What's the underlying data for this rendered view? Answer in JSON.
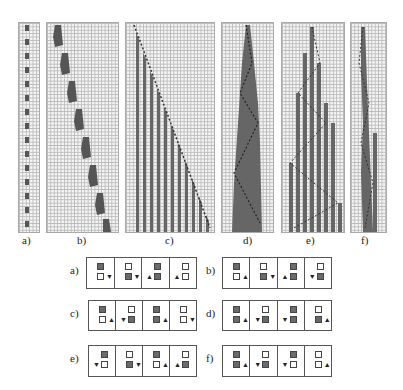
{
  "figure": {
    "top_panels": [
      {
        "label": "a)",
        "pattern": "narrow oscillating head column"
      },
      {
        "label": "b)",
        "pattern": "staircase glider moving right"
      },
      {
        "label": "c)",
        "pattern": "diagonal head leaving vertical stripes"
      },
      {
        "label": "d)",
        "pattern": "expanding filled triangle with zigzag head"
      },
      {
        "label": "e)",
        "pattern": "expanding striped triangle"
      },
      {
        "label": "f)",
        "pattern": "irregular narrow growth"
      }
    ],
    "rule_tables": [
      {
        "label": "a)",
        "cells": [
          {
            "top": "dark",
            "bottom": "light",
            "arrow": "down",
            "side": "right"
          },
          {
            "top": "light",
            "bottom": "dark",
            "arrow": "down",
            "side": "right"
          },
          {
            "top": "dark",
            "bottom": "dark",
            "arrow": "up",
            "side": "left"
          },
          {
            "top": "light",
            "bottom": "light",
            "arrow": "up",
            "side": "left"
          }
        ]
      },
      {
        "label": "b)",
        "cells": [
          {
            "top": "dark",
            "bottom": "light",
            "arrow": "up",
            "side": "right"
          },
          {
            "top": "light",
            "bottom": "dark",
            "arrow": "down",
            "side": "right"
          },
          {
            "top": "dark",
            "bottom": "dark",
            "arrow": "up",
            "side": "left"
          },
          {
            "top": "light",
            "bottom": "dark",
            "arrow": "down",
            "side": "left"
          }
        ]
      },
      {
        "label": "c)",
        "cells": [
          {
            "top": "dark",
            "bottom": "light",
            "arrow": "up",
            "side": "right"
          },
          {
            "top": "light",
            "bottom": "dark",
            "arrow": "down",
            "side": "left"
          },
          {
            "top": "dark",
            "bottom": "dark",
            "arrow": "up",
            "side": "right"
          },
          {
            "top": "light",
            "bottom": "light",
            "arrow": "down",
            "side": "right"
          }
        ]
      },
      {
        "label": "d)",
        "cells": [
          {
            "top": "dark",
            "bottom": "dark",
            "arrow": "up",
            "side": "right"
          },
          {
            "top": "light",
            "bottom": "dark",
            "arrow": "down",
            "side": "left"
          },
          {
            "top": "dark",
            "bottom": "dark",
            "arrow": "down",
            "side": "left"
          },
          {
            "top": "light",
            "bottom": "dark",
            "arrow": "up",
            "side": "right"
          }
        ]
      },
      {
        "label": "e)",
        "cells": [
          {
            "top": "dark",
            "bottom": "light",
            "arrow": "down",
            "side": "left"
          },
          {
            "top": "light",
            "bottom": "dark",
            "arrow": "down",
            "side": "right"
          },
          {
            "top": "dark",
            "bottom": "light",
            "arrow": "up",
            "side": "right"
          },
          {
            "top": "light",
            "bottom": "dark",
            "arrow": "up",
            "side": "left"
          }
        ]
      },
      {
        "label": "f)",
        "cells": [
          {
            "top": "dark",
            "bottom": "dark",
            "arrow": "up",
            "side": "right"
          },
          {
            "top": "light",
            "bottom": "dark",
            "arrow": "down",
            "side": "left"
          },
          {
            "top": "dark",
            "bottom": "light",
            "arrow": "down",
            "side": "left"
          },
          {
            "top": "light",
            "bottom": "light",
            "arrow": "up",
            "side": "right"
          }
        ]
      }
    ]
  }
}
